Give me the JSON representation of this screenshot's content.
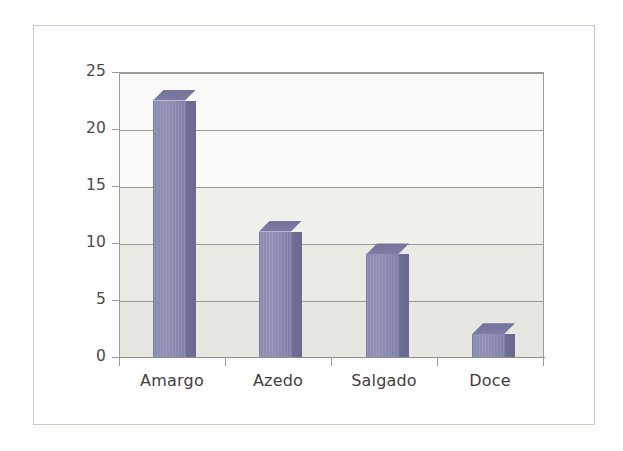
{
  "chart_data": {
    "type": "bar",
    "title": "",
    "subtitle": "",
    "xlabel": "",
    "ylabel": "",
    "categories": [
      "Amargo",
      "Azedo",
      "Salgado",
      "Doce"
    ],
    "values": [
      22.5,
      11,
      9,
      2
    ],
    "series": [
      {
        "name": "",
        "values": [
          22.5,
          11,
          9,
          2
        ]
      }
    ],
    "ylim": [
      0,
      25
    ],
    "yticks": [
      0,
      5,
      10,
      15,
      20,
      25
    ],
    "ytick_labels": [
      "0",
      "5",
      "10",
      "15",
      "20",
      "25"
    ],
    "grid": true,
    "grid_axis": "y",
    "legend": false,
    "legend_position": "none",
    "bar_style": "3d-column",
    "colors": {
      "bar_front": "#8a8ab0",
      "bar_side": "#6f6f96",
      "bar_top": "#72729a",
      "plot_background": "#f0f0ea",
      "gridline": "#9a9a96",
      "axis": "#9a9a96",
      "tick_text": "#4a4a4a",
      "frame_border": "#c8c8c4",
      "page_background": "#fdfdfc"
    }
  },
  "axes": {
    "y": {
      "ticks": [
        {
          "label": "25",
          "value": 25
        },
        {
          "label": "20",
          "value": 20
        },
        {
          "label": "15",
          "value": 15
        },
        {
          "label": "10",
          "value": 10
        },
        {
          "label": "5",
          "value": 5
        },
        {
          "label": "0",
          "value": 0
        }
      ]
    },
    "x": {
      "ticks": [
        {
          "label": "Amargo"
        },
        {
          "label": "Azedo"
        },
        {
          "label": "Salgado"
        },
        {
          "label": "Doce"
        }
      ]
    }
  }
}
